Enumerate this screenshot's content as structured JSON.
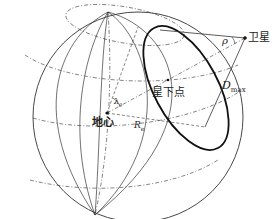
{
  "diagram": {
    "type": "satellite-earth-coverage-geometry",
    "labels": {
      "satellite": "卫星",
      "subsatellite_point": "星下点",
      "earth_center": "地心",
      "angle_rho": "ρ",
      "max_distance": "D",
      "max_distance_sub": "max",
      "earth_radius": "R",
      "earth_radius_sub": "e",
      "central_angle": "λ",
      "central_angle_sub": "0"
    },
    "colors": {
      "line": "#333333",
      "background": "#ffffff"
    }
  }
}
